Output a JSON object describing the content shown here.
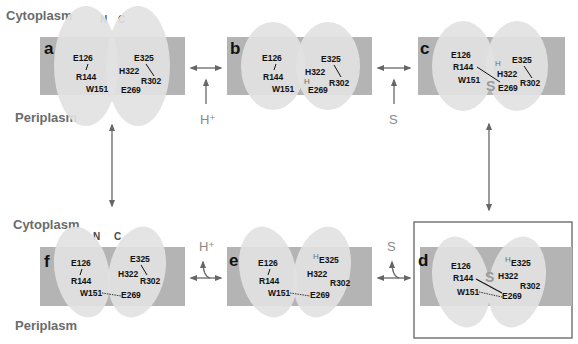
{
  "regions": {
    "top_cytoplasm": "Cytoplasm",
    "top_periplasm": "Periplasm",
    "bottom_cytoplasm": "Cytoplasm",
    "bottom_periplasm": "Periplasm"
  },
  "domains": {
    "n": "N",
    "c": "C"
  },
  "colors": {
    "membrane": "#b4b4b4",
    "domain_ellipse": "#e2e2e2",
    "arrow": "#666666",
    "substrate": "#9a9a9a",
    "text": "#111111"
  },
  "substrates": {
    "proton": "H⁺",
    "substrate": "S",
    "h": "H"
  },
  "panels": {
    "a": {
      "label": "a",
      "residues": {
        "E126": "E126",
        "R144": "R144",
        "W151": "W151",
        "E325": "E325",
        "H322": "H322",
        "R302": "R302",
        "E269": "E269"
      }
    },
    "b": {
      "label": "b",
      "residues": {
        "E126": "E126",
        "R144": "R144",
        "W151": "W151",
        "E325": "E325",
        "H322": "H322",
        "R302": "R302",
        "E269": "E269"
      }
    },
    "c": {
      "label": "c",
      "residues": {
        "E126": "E126",
        "R144": "R144",
        "W151": "W151",
        "E325": "E325",
        "H322": "H322",
        "R302": "R302",
        "E269": "E269"
      }
    },
    "d": {
      "label": "d",
      "residues": {
        "E126": "E126",
        "R144": "R144",
        "W151": "W151",
        "E325": "E325",
        "H322": "H322",
        "R302": "R302",
        "E269": "E269"
      }
    },
    "e": {
      "label": "e",
      "residues": {
        "E126": "E126",
        "R144": "R144",
        "W151": "W151",
        "E325": "E325",
        "H322": "H322",
        "R302": "R302",
        "E269": "E269"
      }
    },
    "f": {
      "label": "f",
      "residues": {
        "E126": "E126",
        "R144": "R144",
        "W151": "W151",
        "E325": "E325",
        "H322": "H322",
        "R302": "R302",
        "E269": "E269"
      }
    }
  },
  "transitions": [
    {
      "from": "a",
      "to": "b",
      "input": "H⁺"
    },
    {
      "from": "b",
      "to": "c",
      "input": "S"
    },
    {
      "from": "c",
      "to": "d",
      "input": ""
    },
    {
      "from": "d",
      "to": "e",
      "output": "S"
    },
    {
      "from": "e",
      "to": "f",
      "output": "H⁺"
    },
    {
      "from": "f",
      "to": "a",
      "input": ""
    }
  ]
}
